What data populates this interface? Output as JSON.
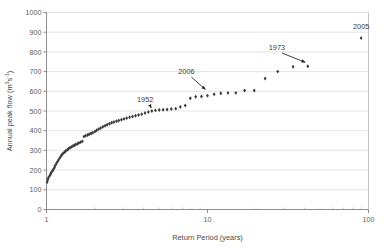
{
  "chart_data": {
    "type": "scatter",
    "title": "",
    "xlabel": "Return Period (years)",
    "ylabel": "Annual peak flow (m3s-1)",
    "ylabel_parts": {
      "prefix": "Annual peak flow (m",
      "sup1": "3",
      "mid": "s",
      "sup2": "-1",
      "suffix": ")"
    },
    "xscale": "log",
    "yscale": "linear",
    "xlim": [
      1,
      100
    ],
    "ylim": [
      0,
      1000
    ],
    "grid": "horizontal",
    "legend": "none",
    "xticks": [
      1,
      10,
      100
    ],
    "xtick_labels": [
      "1",
      "10",
      "100"
    ],
    "yticks": [
      0,
      100,
      200,
      300,
      400,
      500,
      600,
      700,
      800,
      900,
      1000
    ],
    "ytick_labels": [
      "0",
      "100",
      "200",
      "300",
      "400",
      "500",
      "600",
      "700",
      "800",
      "900",
      "1000"
    ],
    "marker": "diamond",
    "marker_color": "#3a3a3a",
    "series_name": "Annual peak flow",
    "x": [
      1.01,
      1.02,
      1.03,
      1.05,
      1.06,
      1.07,
      1.09,
      1.1,
      1.12,
      1.13,
      1.15,
      1.17,
      1.19,
      1.21,
      1.23,
      1.25,
      1.27,
      1.3,
      1.32,
      1.35,
      1.37,
      1.4,
      1.43,
      1.46,
      1.49,
      1.52,
      1.56,
      1.59,
      1.63,
      1.67,
      1.71,
      1.75,
      1.8,
      1.84,
      1.89,
      1.94,
      2.0,
      2.05,
      2.11,
      2.17,
      2.24,
      2.31,
      2.38,
      2.46,
      2.54,
      2.62,
      2.72,
      2.81,
      2.92,
      3.03,
      3.15,
      3.28,
      3.42,
      3.57,
      3.73,
      3.9,
      4.09,
      4.29,
      4.51,
      4.75,
      5.01,
      5.3,
      5.61,
      5.96,
      6.35,
      6.78,
      7.27,
      7.82,
      8.45,
      9.17,
      10.0,
      11.0,
      12.1,
      13.4,
      15.0,
      17.0,
      19.5,
      22.8,
      27.3,
      34.0,
      42.0,
      90.0
    ],
    "y": [
      140,
      152,
      163,
      172,
      180,
      188,
      196,
      203,
      212,
      222,
      232,
      243,
      252,
      262,
      271,
      279,
      286,
      292,
      298,
      303,
      308,
      313,
      318,
      322,
      326,
      330,
      334,
      338,
      342,
      346,
      370,
      375,
      378,
      382,
      386,
      390,
      396,
      402,
      408,
      414,
      420,
      425,
      430,
      435,
      440,
      444,
      448,
      452,
      456,
      460,
      464,
      468,
      472,
      476,
      480,
      484,
      490,
      495,
      500,
      503,
      505,
      506,
      508,
      510,
      512,
      520,
      528,
      565,
      572,
      574,
      578,
      585,
      590,
      592,
      592,
      604,
      604,
      665,
      700,
      725,
      727,
      870
    ],
    "annotations": [
      {
        "label": "1952",
        "text_x": 4.1,
        "text_y": 545,
        "point_x": 4.55,
        "point_y": 503,
        "has_arrow": true
      },
      {
        "label": "2006",
        "text_x": 7.4,
        "text_y": 690,
        "point_x": 10.0,
        "point_y": 600,
        "has_arrow": true
      },
      {
        "label": "1973",
        "text_x": 27.0,
        "text_y": 812,
        "point_x": 42.0,
        "point_y": 742,
        "has_arrow": true
      },
      {
        "label": "2005",
        "text_x": 90.0,
        "text_y": 915,
        "point_x": 90.0,
        "point_y": 870,
        "has_arrow": false
      }
    ]
  }
}
